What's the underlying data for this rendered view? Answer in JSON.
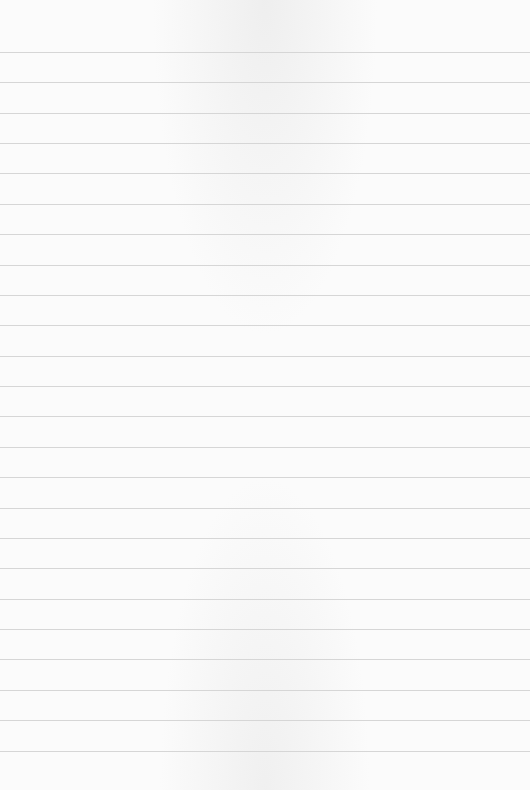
{
  "paper": {
    "type": "lined-paper",
    "background_color": "#fbfbfb",
    "rule_color": "#d6d6d6",
    "rule_count": 24,
    "first_rule_y": 52,
    "rule_spacing": 30.37
  }
}
